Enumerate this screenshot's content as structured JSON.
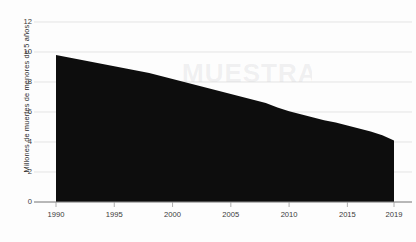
{
  "chart_data": {
    "type": "area",
    "title": "",
    "subtitle": "",
    "xlabel": "",
    "ylabel": "Millones de muertes de menores de 5 años",
    "x": [
      1990,
      1991,
      1992,
      1993,
      1994,
      1995,
      1996,
      1997,
      1998,
      1999,
      2000,
      2001,
      2002,
      2003,
      2004,
      2005,
      2006,
      2007,
      2008,
      2009,
      2010,
      2011,
      2012,
      2013,
      2014,
      2015,
      2016,
      2017,
      2018,
      2019
    ],
    "values": [
      9.8,
      9.65,
      9.5,
      9.35,
      9.2,
      9.05,
      8.9,
      8.75,
      8.6,
      8.4,
      8.2,
      8.0,
      7.8,
      7.6,
      7.4,
      7.2,
      7.0,
      6.8,
      6.6,
      6.3,
      6.05,
      5.85,
      5.65,
      5.45,
      5.3,
      5.1,
      4.9,
      4.7,
      4.45,
      4.1
    ],
    "series": [
      {
        "name": "Muertes de menores de 5 años",
        "values": [
          9.8,
          9.65,
          9.5,
          9.35,
          9.2,
          9.05,
          8.9,
          8.75,
          8.6,
          8.4,
          8.2,
          8.0,
          7.8,
          7.6,
          7.4,
          7.2,
          7.0,
          6.8,
          6.6,
          6.3,
          6.05,
          5.85,
          5.65,
          5.45,
          5.3,
          5.1,
          4.9,
          4.7,
          4.45,
          4.1
        ],
        "color": "#0d0d0d"
      }
    ],
    "xlim": [
      1990,
      2019
    ],
    "ylim": [
      0,
      12
    ],
    "y_ticks": [
      0,
      2,
      4,
      6,
      8,
      10,
      12
    ],
    "y_tick_labels": [
      "0",
      "2",
      "4",
      "6",
      "8",
      "10",
      "12"
    ],
    "x_ticks": [
      1990,
      1995,
      2000,
      2005,
      2010,
      2015,
      2019
    ],
    "x_tick_labels": [
      "1990",
      "1995",
      "2000",
      "2005",
      "2010",
      "2015",
      "2019"
    ],
    "grid": true,
    "grid_axis": "y",
    "grid_color": "#d8d8d8",
    "axis_color": "#9a9a9a",
    "legend": false,
    "legend_position": "none",
    "background_color": "#fdfdfd",
    "fill_color": "#0d0d0d",
    "annotations": []
  },
  "watermark": {
    "text": "MUESTRA"
  }
}
